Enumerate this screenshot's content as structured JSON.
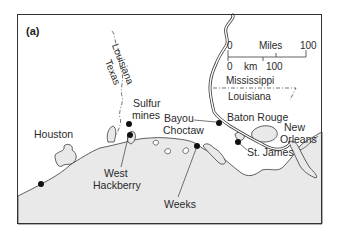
{
  "figure": {
    "panel_label": "(a)",
    "colors": {
      "land": "#ffffff",
      "water": "#e9e9e9",
      "line": "#3a3a3a",
      "frame": "#333333",
      "text": "#2a2a2a"
    }
  },
  "state_labels": {
    "louisiana_west": "Louisiana",
    "texas": "Texas",
    "mississippi": "Mississippi",
    "louisiana_east": "Louisiana"
  },
  "scale_bar": {
    "miles_label": "Miles",
    "miles_start": "0",
    "miles_end": "100",
    "km_label": "km",
    "km_start": "0",
    "km_end": "100"
  },
  "places": [
    {
      "id": "houston",
      "name": "Houston",
      "marker": true
    },
    {
      "id": "sulfur-mines",
      "name_line1": "Sulfur",
      "name_line2": "mines",
      "marker": true
    },
    {
      "id": "west-hackberry",
      "name_line1": "West",
      "name_line2": "Hackberry",
      "marker": true
    },
    {
      "id": "bayou-choctaw",
      "name_line1": "Bayou",
      "name_line2": "Choctaw",
      "marker": true
    },
    {
      "id": "baton-rouge",
      "name": "Baton Rouge",
      "marker": false
    },
    {
      "id": "new-orleans",
      "name_line1": "New",
      "name_line2": "Orleans",
      "marker": false
    },
    {
      "id": "st-james",
      "name": "St. James",
      "marker": true
    },
    {
      "id": "weeks",
      "name": "Weeks",
      "marker": true
    }
  ]
}
